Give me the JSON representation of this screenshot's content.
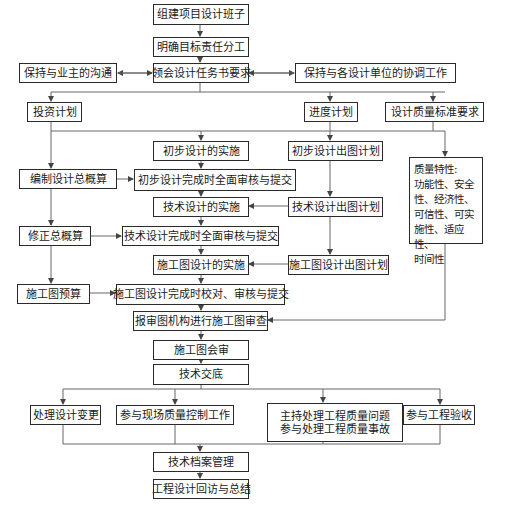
{
  "diagram": {
    "type": "flowchart",
    "language": "zh",
    "nodes": {
      "form_team": "组建项目设计班子",
      "clarify_goals": "明确目标责任分工",
      "understand_brief": "领会设计任务书要求",
      "owner_comm": "保持与业主的沟通",
      "unit_coord": "保持与各设计单位的协调工作",
      "investment_plan": "投资计划",
      "schedule_plan": "进度计划",
      "quality_std": "设计质量标准要求",
      "prelim_impl": "初步设计的实施",
      "prelim_drawing_plan": "初步设计出图计划",
      "budget_estimate": "编制设计总概算",
      "prelim_review": "初步设计完成时全面审核与提交",
      "tech_impl": "技术设计的实施",
      "tech_drawing_plan": "技术设计出图计划",
      "quality_traits": {
        "title": "质量特性:",
        "lines": [
          "功能性、安全",
          "性、经济性、",
          "可信性、可实",
          "施性、适应性、",
          "时间性"
        ]
      },
      "revise_estimate": "修正总概算",
      "tech_review": "技术设计完成时全面审核与提交",
      "cd_impl": "施工图设计的实施",
      "cd_drawing_plan": "施工图设计出图计划",
      "cd_budget": "施工图预算",
      "cd_review": "施工图设计完成时校对、审核与提交",
      "authority_review": "报审图机构进行施工图审查",
      "joint_review": "施工图会审",
      "tech_briefing": "技术交底",
      "handle_changes": "处理设计变更",
      "site_quality": "参与现场质量控制工作",
      "quality_issues": {
        "line1": "主持处理工程质量问题",
        "line2": "参与处理工程质量事故"
      },
      "acceptance": "参与工程验收",
      "archive_mgmt": "技术档案管理",
      "followup": "工程设计回访与总结"
    },
    "edges": [
      [
        "form_team",
        "clarify_goals"
      ],
      [
        "clarify_goals",
        "understand_brief"
      ],
      [
        "understand_brief",
        "owner_comm",
        "bidirectional"
      ],
      [
        "understand_brief",
        "unit_coord",
        "bidirectional"
      ],
      [
        "understand_brief",
        "investment_plan"
      ],
      [
        "understand_brief",
        "schedule_plan"
      ],
      [
        "understand_brief",
        "quality_std"
      ],
      [
        "quality_std",
        "prelim_impl"
      ],
      [
        "schedule_plan",
        "prelim_drawing_plan"
      ],
      [
        "quality_std",
        "quality_traits"
      ],
      [
        "investment_plan",
        "budget_estimate"
      ],
      [
        "prelim_impl",
        "prelim_review"
      ],
      [
        "budget_estimate",
        "prelim_review"
      ],
      [
        "prelim_review",
        "tech_impl"
      ],
      [
        "prelim_drawing_plan",
        "tech_drawing_plan"
      ],
      [
        "tech_drawing_plan",
        "tech_impl"
      ],
      [
        "budget_estimate",
        "revise_estimate"
      ],
      [
        "tech_impl",
        "tech_review"
      ],
      [
        "revise_estimate",
        "tech_review"
      ],
      [
        "tech_review",
        "cd_impl"
      ],
      [
        "tech_drawing_plan",
        "cd_drawing_plan"
      ],
      [
        "cd_drawing_plan",
        "cd_impl"
      ],
      [
        "revise_estimate",
        "cd_budget"
      ],
      [
        "cd_impl",
        "cd_review"
      ],
      [
        "cd_budget",
        "cd_review"
      ],
      [
        "cd_review",
        "authority_review"
      ],
      [
        "quality_traits",
        "authority_review"
      ],
      [
        "authority_review",
        "joint_review"
      ],
      [
        "joint_review",
        "tech_briefing"
      ],
      [
        "tech_briefing",
        "handle_changes"
      ],
      [
        "tech_briefing",
        "site_quality"
      ],
      [
        "tech_briefing",
        "quality_issues"
      ],
      [
        "tech_briefing",
        "acceptance"
      ],
      [
        "handle_changes",
        "archive_mgmt"
      ],
      [
        "site_quality",
        "archive_mgmt"
      ],
      [
        "quality_issues",
        "archive_mgmt"
      ],
      [
        "acceptance",
        "archive_mgmt"
      ],
      [
        "archive_mgmt",
        "followup"
      ]
    ],
    "colors": {
      "line": "#555555",
      "border": "#2a2a2a",
      "background": "#ffffff",
      "text": "#1a1a1a"
    }
  }
}
